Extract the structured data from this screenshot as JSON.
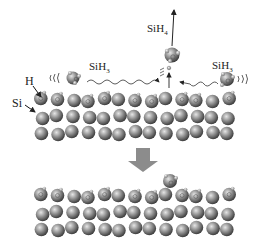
{
  "labels": {
    "h": "H",
    "si": "Si",
    "sih3_left": {
      "base": "SiH",
      "sub": "3"
    },
    "sih4": {
      "base": "SiH",
      "sub": "4"
    },
    "sih3_right": {
      "base": "SiH",
      "sub": "3"
    }
  },
  "colors": {
    "atom_dark": "#4a4a4a",
    "atom_mid": "#8a8a8a",
    "atom_light": "#d8d8d8",
    "arrow_fill": "#8c8c8c",
    "line": "#222222"
  },
  "slabs": {
    "top": {
      "rows_y": [
        100,
        117,
        133
      ],
      "x_start": 42,
      "spacing": 15.5,
      "count": 13
    },
    "bottom": {
      "rows_y": [
        196,
        213,
        229
      ],
      "x_start": 42,
      "spacing": 15.5,
      "count": 13
    }
  },
  "process_arrow": {
    "direction": "down"
  }
}
